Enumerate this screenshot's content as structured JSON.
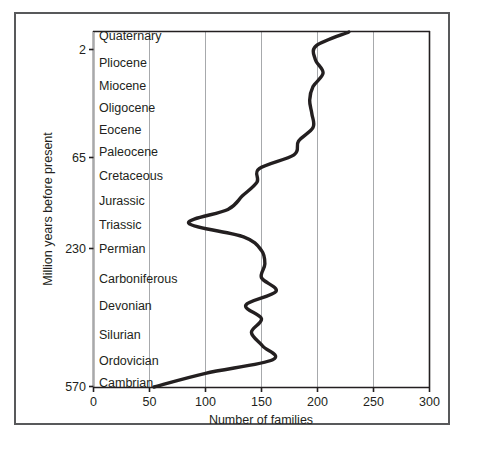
{
  "chart_data": {
    "type": "line",
    "title": "",
    "xlabel": "Number of families",
    "ylabel": "Million years before present",
    "xlim": [
      0,
      300
    ],
    "ylim": [
      570,
      0
    ],
    "grid": true,
    "legend": "none",
    "xticks": [
      {
        "value": 0,
        "label": "0"
      },
      {
        "value": 50,
        "label": "50"
      },
      {
        "value": 100,
        "label": "100"
      },
      {
        "value": 150,
        "label": "150"
      },
      {
        "value": 200,
        "label": "200"
      },
      {
        "value": 250,
        "label": "250"
      },
      {
        "value": 300,
        "label": "300"
      }
    ],
    "yticks": [
      {
        "value": 2,
        "label": "2"
      },
      {
        "value": 65,
        "label": "65"
      },
      {
        "value": 230,
        "label": "230"
      },
      {
        "value": 570,
        "label": "570"
      }
    ],
    "period_labels": [
      "Quaternary",
      "Pliocene",
      "Miocene",
      "Oligocene",
      "Eocene",
      "Paleocene",
      "Cretaceous",
      "Jurassic",
      "Triassic",
      "Permian",
      "Carboniferous",
      "Devonian",
      "Silurian",
      "Ordovician",
      "Cambrian"
    ],
    "series": [
      {
        "name": "Number of families",
        "points": [
          {
            "period": "Cambrian",
            "families": 54
          },
          {
            "period": "Cambrian",
            "families": 100
          },
          {
            "period": "Ordovician",
            "families": 160
          },
          {
            "period": "Ordovician",
            "families": 151
          },
          {
            "period": "Ordovician",
            "families": 141
          },
          {
            "period": "Silurian",
            "families": 150
          },
          {
            "period": "Silurian",
            "families": 136
          },
          {
            "period": "Silurian",
            "families": 163
          },
          {
            "period": "Devonian",
            "families": 150
          },
          {
            "period": "Devonian",
            "families": 153
          },
          {
            "period": "Carboniferous",
            "families": 150
          },
          {
            "period": "Carboniferous",
            "families": 134
          },
          {
            "period": "Permian",
            "families": 85
          },
          {
            "period": "Permian",
            "families": 120
          },
          {
            "period": "Triassic",
            "families": 133
          },
          {
            "period": "Triassic",
            "families": 146
          },
          {
            "period": "Jurassic",
            "families": 148
          },
          {
            "period": "Jurassic",
            "families": 179
          },
          {
            "period": "Cretaceous",
            "families": 183
          },
          {
            "period": "Cretaceous",
            "families": 196
          },
          {
            "period": "Paleocene",
            "families": 195
          },
          {
            "period": "Eocene",
            "families": 193
          },
          {
            "period": "Oligocene",
            "families": 196
          },
          {
            "period": "Miocene",
            "families": 205
          },
          {
            "period": "Pliocene",
            "families": 198
          },
          {
            "period": "Pliocene",
            "families": 199
          },
          {
            "period": "Quaternary",
            "families": 228
          }
        ]
      }
    ],
    "colors": {
      "curve": "#231f20",
      "grid": "#a7a9ac",
      "axis": "#231f20",
      "frame": "#58595b",
      "background": "#ffffff"
    }
  }
}
